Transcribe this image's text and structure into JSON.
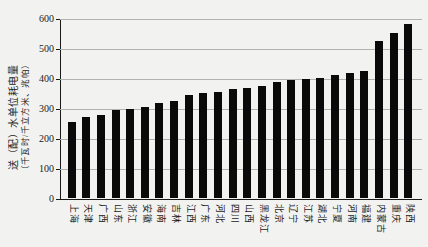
{
  "page": {
    "background": "#f2f2f0"
  },
  "chart_data": {
    "type": "bar",
    "title": "",
    "ylabel_line1": "送（配）水单位耗电量",
    "ylabel_line2": "（千瓦时/千立方米、兆帕）",
    "xlabel": "",
    "legend": "none",
    "grid": "horizontal",
    "bar_color": "#0a0a0a",
    "axis_color": "#1a1a1a",
    "gridline_color": "#b2b2ae",
    "ylim": [
      0,
      600
    ],
    "yticks": [
      0,
      100,
      200,
      300,
      400,
      500,
      600
    ],
    "categories": [
      "上海",
      "天津",
      "广西",
      "山东",
      "浙江",
      "安徽",
      "海南",
      "吉林",
      "江西",
      "广东",
      "河北",
      "四川",
      "山西",
      "黑龙江",
      "北京",
      "辽宁",
      "江苏",
      "湖北",
      "宁夏",
      "河南",
      "福建",
      "内蒙古",
      "重庆",
      "陕西"
    ],
    "values": [
      253,
      270,
      276,
      293,
      296,
      305,
      318,
      324,
      344,
      349,
      352,
      363,
      366,
      374,
      387,
      395,
      397,
      400,
      409,
      417,
      424,
      523,
      551,
      580
    ]
  }
}
